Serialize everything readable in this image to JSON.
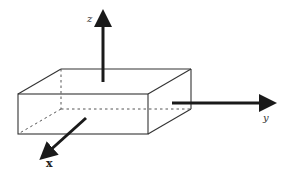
{
  "diagram": {
    "colors": {
      "background": "#ffffff",
      "line": "#333333",
      "axis": "#1a1a1a"
    },
    "box": {
      "front_top_left": [
        18,
        94
      ],
      "front_top_right": [
        148,
        94
      ],
      "front_bottom_left": [
        18,
        134
      ],
      "front_bottom_right": [
        148,
        134
      ],
      "back_top_left": [
        61,
        69
      ],
      "back_top_right": [
        191,
        69
      ],
      "back_bottom_right": [
        191,
        109
      ],
      "back_bottom_left_hidden": [
        61,
        109
      ]
    },
    "axes": [
      {
        "name": "z",
        "label": "z",
        "from": [
          103,
          82
        ],
        "to": [
          103,
          10
        ],
        "label_pos": [
          88,
          22
        ]
      },
      {
        "name": "y",
        "label": "y",
        "from": [
          172,
          103
        ],
        "to": [
          278,
          103
        ],
        "label_pos": [
          264,
          121
        ]
      },
      {
        "name": "x",
        "label": "x",
        "from": [
          86,
          118
        ],
        "to": [
          40,
          159
        ],
        "label_pos": [
          46,
          167
        ]
      }
    ]
  }
}
